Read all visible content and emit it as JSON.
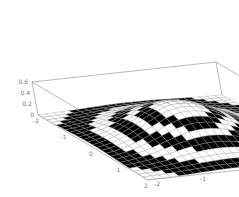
{
  "chart_data": {
    "type": "surface3d",
    "title": "",
    "function_description": "Radially symmetric surface, checkered black/white by height bands over x,y in [-2,2]",
    "x_range": [
      -2,
      2
    ],
    "y_range": [
      -2,
      2
    ],
    "z_range": [
      0,
      0.6
    ],
    "grid_divisions": 24,
    "x_ticks": [
      "-2",
      "-1",
      "0",
      "1",
      "2"
    ],
    "y_ticks": [
      "-2",
      "-1",
      "0",
      "1",
      "2"
    ],
    "z_ticks": [
      "0",
      "0.2",
      "0.4",
      "0.6"
    ],
    "band_count": 6,
    "colors": {
      "light": "#ffffff",
      "dark": "#000000",
      "mesh": "#9a9a9a",
      "box": "#8a8a8a",
      "labels": "#777777"
    },
    "box": {
      "origin": [
        38,
        115
      ],
      "x_vec": [
        110,
        65
      ],
      "y_vec": [
        184,
        -20
      ],
      "z_vec": [
        -6,
        -33
      ]
    }
  },
  "axis_labels": {
    "z_ticks_display": [
      "0",
      "0.2",
      "0.4",
      "0.6"
    ],
    "x_ticks_display": [
      "-2",
      "-1",
      "0",
      "1",
      "2"
    ],
    "y_ticks_display": [
      "-2",
      "-1",
      "0",
      "1",
      "2"
    ]
  }
}
